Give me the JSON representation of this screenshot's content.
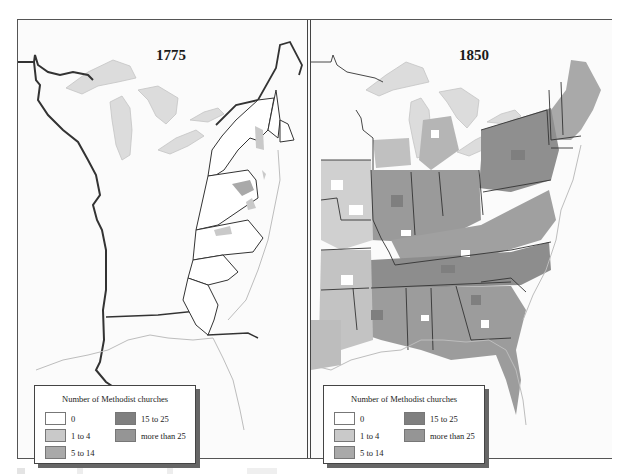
{
  "maps": [
    {
      "year": "1775",
      "legend": {
        "title": "Number of Methodist churches",
        "items": [
          {
            "label": "0",
            "color": "#ffffff"
          },
          {
            "label": "1 to 4",
            "color": "#c9c9c9"
          },
          {
            "label": "5 to 14",
            "color": "#a9a9a9"
          },
          {
            "label": "15 to 25",
            "color": "#7f7f7f"
          },
          {
            "label": "more than 25",
            "color": "#959595"
          }
        ]
      }
    },
    {
      "year": "1850",
      "legend": {
        "title": "Number of Methodist churches",
        "items": [
          {
            "label": "0",
            "color": "#ffffff"
          },
          {
            "label": "1 to 4",
            "color": "#c9c9c9"
          },
          {
            "label": "5 to 14",
            "color": "#a9a9a9"
          },
          {
            "label": "15 to 25",
            "color": "#7f7f7f"
          },
          {
            "label": "more than 25",
            "color": "#959595"
          }
        ]
      }
    }
  ],
  "colors": {
    "lakes": "#dcdcdc",
    "coast": "#bdbdbd",
    "border": "#333333"
  }
}
